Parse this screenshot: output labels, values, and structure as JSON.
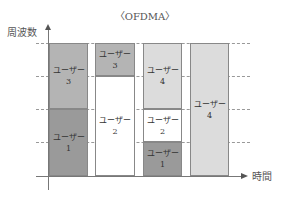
{
  "title": "〈OFDMA〉",
  "axes": {
    "y_label": "周波数",
    "x_label": "時間"
  },
  "colors": {
    "user1": "#9a9a9a",
    "user2": "#ffffff",
    "user3": "#b4b4b4",
    "user4": "#dcdcdc"
  },
  "columns": [
    {
      "blocks": [
        {
          "user": "ユーザー",
          "num": "3"
        },
        {
          "user": "ユーザー",
          "num": "1"
        }
      ]
    },
    {
      "blocks": [
        {
          "user": "ユーザー",
          "num": "3"
        },
        {
          "user": "ユーザー",
          "num": "2"
        }
      ]
    },
    {
      "blocks": [
        {
          "user": "ユーザー",
          "num": "4"
        },
        {
          "user": "ユーザー",
          "num": "2"
        },
        {
          "user": "ユーザー",
          "num": "1"
        }
      ]
    },
    {
      "blocks": [
        {
          "user": "ユーザー",
          "num": "4"
        }
      ]
    }
  ]
}
